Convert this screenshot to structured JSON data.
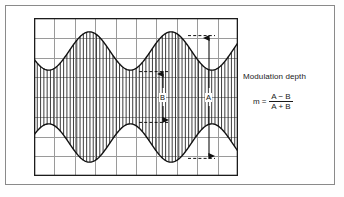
{
  "figure": {
    "background_color": "#ffffff",
    "frame_color": "#8a8a8a"
  },
  "scope": {
    "grid": {
      "columns": 10,
      "rows": 8,
      "line_color": "#9a9a9a",
      "border_color": "#1c1c1c",
      "x": 34,
      "y": 18,
      "width": 204,
      "height": 158
    },
    "waveform": {
      "type": "amplitude-modulated-carrier",
      "trace_color": "#111111",
      "carrier_fill": "vertical-hatching",
      "carrier_line_count": 62,
      "envelope_cycles": 2.5,
      "center_line_value": 0,
      "peak_amplitude_A": 1.0,
      "trough_amplitude_B": 0.36
    }
  },
  "annotations": {
    "measure_b": {
      "label": "B",
      "description": "double-headed arrow spanning envelope minimum",
      "arrow_style": "double-headed",
      "dashed_guides": 2
    },
    "measure_a": {
      "label": "A",
      "description": "double-headed arrow spanning envelope maximum",
      "arrow_style": "double-headed",
      "dashed_guides": 2
    }
  },
  "text_block": {
    "title": "Modulation depth",
    "formula": {
      "lhs": "m",
      "equals": "=",
      "numerator": "A − B",
      "denominator": "A + B"
    }
  },
  "chart_data": {
    "type": "line",
    "title": "Modulation depth",
    "xlabel": "",
    "ylabel": "",
    "xlim": [
      0,
      10
    ],
    "ylim": [
      -4,
      4
    ],
    "grid": true,
    "legend": null,
    "annotations": [
      "A",
      "B",
      "Modulation depth",
      "m = (A - B) / (A + B)"
    ],
    "series": [
      {
        "name": "upper envelope",
        "description": "1 + 0.32*cos(2*pi*x/4) scaled, peaks at x=2 and x=6 (grid divisions)",
        "x": [
          0.0,
          0.5,
          1.0,
          1.5,
          2.0,
          2.5,
          3.0,
          3.5,
          4.0,
          4.5,
          5.0,
          5.5,
          6.0,
          6.5,
          7.0,
          7.5,
          8.0,
          8.5,
          9.0,
          9.5,
          10.0
        ],
        "values": [
          2.1,
          1.72,
          1.36,
          1.36,
          1.72,
          2.4,
          3.0,
          3.3,
          3.0,
          2.4,
          1.72,
          1.36,
          1.36,
          1.72,
          2.4,
          3.0,
          3.3,
          3.0,
          2.4,
          1.72,
          1.5
        ]
      },
      {
        "name": "lower envelope",
        "description": "mirror image of upper envelope about y=0",
        "x": [
          0.0,
          0.5,
          1.0,
          1.5,
          2.0,
          2.5,
          3.0,
          3.5,
          4.0,
          4.5,
          5.0,
          5.5,
          6.0,
          6.5,
          7.0,
          7.5,
          8.0,
          8.5,
          9.0,
          9.5,
          10.0
        ],
        "values": [
          -2.1,
          -1.72,
          -1.36,
          -1.36,
          -1.72,
          -2.4,
          -3.0,
          -3.3,
          -3.0,
          -2.4,
          -1.72,
          -1.36,
          -1.36,
          -1.72,
          -2.4,
          -3.0,
          -3.3,
          -3.0,
          -2.4,
          -1.72,
          -1.5
        ]
      }
    ],
    "measurements": [
      {
        "label": "A",
        "value": 6.6,
        "units": "divisions (peak-to-peak at envelope maximum)"
      },
      {
        "label": "B",
        "value": 2.72,
        "units": "divisions (peak-to-peak at envelope minimum)"
      }
    ]
  }
}
